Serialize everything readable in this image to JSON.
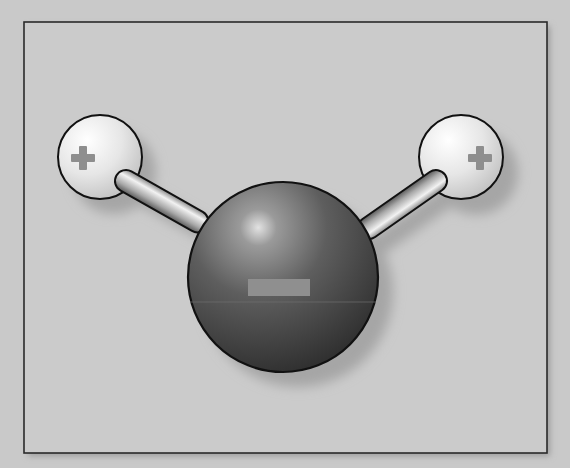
{
  "diagram": {
    "colors": {
      "background": "#c9c9c9",
      "frame_fill": "#cbcbcb",
      "frame_stroke": "#2a2a2a",
      "hydrogen_light": "#f4f4f4",
      "hydrogen_dark": "#bdbdbd",
      "oxygen_light": "#d8d8d8",
      "oxygen_dark": "#383838",
      "bond_light": "#f0f0f0",
      "bond_dark": "#6a6a6a",
      "charge_mark": "#9a9a9a",
      "shadow": "#a8a8a8"
    },
    "atoms": [
      {
        "id": "hydrogen-left",
        "charge": "+",
        "cx": 100,
        "cy": 157,
        "r": 42
      },
      {
        "id": "hydrogen-right",
        "charge": "+",
        "cx": 461,
        "cy": 157,
        "r": 42
      },
      {
        "id": "oxygen-center",
        "charge": "−",
        "cx": 283,
        "cy": 277,
        "r": 95
      }
    ],
    "bonds": [
      {
        "id": "bond-left",
        "from": "hydrogen-left",
        "to": "oxygen-center"
      },
      {
        "id": "bond-right",
        "from": "hydrogen-right",
        "to": "oxygen-center"
      }
    ]
  }
}
